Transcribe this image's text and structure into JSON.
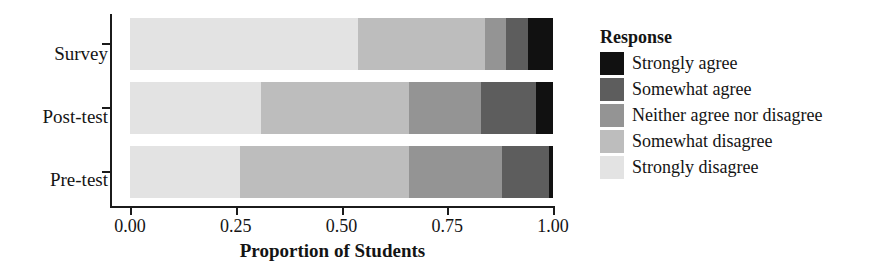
{
  "chart_data": {
    "type": "bar",
    "orientation": "horizontal",
    "stacked": true,
    "normalized": true,
    "title": "",
    "xlabel": "Proportion of Students",
    "ylabel": "",
    "xlim": [
      0.0,
      1.0
    ],
    "grid": false,
    "legend_position": "right",
    "legend_title": "Response",
    "categories": [
      "Pre-test",
      "Post-test",
      "Survey"
    ],
    "category_order_top_to_bottom": [
      "Survey",
      "Post-test",
      "Pre-test"
    ],
    "xticks": [
      "0.00",
      "0.25",
      "0.50",
      "0.75",
      "1.00"
    ],
    "xtick_values": [
      0.0,
      0.25,
      0.5,
      0.75,
      1.0
    ],
    "series": [
      {
        "name": "Strongly disagree",
        "color": "#e3e3e3",
        "values": [
          0.26,
          0.31,
          0.54
        ]
      },
      {
        "name": "Somewhat disagree",
        "color": "#bdbdbd",
        "values": [
          0.4,
          0.35,
          0.3
        ]
      },
      {
        "name": "Neither agree nor disagree",
        "color": "#949494",
        "values": [
          0.22,
          0.17,
          0.05
        ]
      },
      {
        "name": "Somewhat agree",
        "color": "#5d5d5d",
        "values": [
          0.11,
          0.13,
          0.05
        ]
      },
      {
        "name": "Strongly agree",
        "color": "#111111",
        "values": [
          0.01,
          0.04,
          0.06
        ]
      }
    ],
    "bars": [
      {
        "category": "Survey",
        "segments": [
          {
            "label": "Strongly disagree",
            "value": 0.54,
            "color": "#e3e3e3"
          },
          {
            "label": "Somewhat disagree",
            "value": 0.3,
            "color": "#bdbdbd"
          },
          {
            "label": "Neither agree nor disagree",
            "value": 0.05,
            "color": "#949494"
          },
          {
            "label": "Somewhat agree",
            "value": 0.05,
            "color": "#5d5d5d"
          },
          {
            "label": "Strongly agree",
            "value": 0.06,
            "color": "#111111"
          }
        ]
      },
      {
        "category": "Post-test",
        "segments": [
          {
            "label": "Strongly disagree",
            "value": 0.31,
            "color": "#e3e3e3"
          },
          {
            "label": "Somewhat disagree",
            "value": 0.35,
            "color": "#bdbdbd"
          },
          {
            "label": "Neither agree nor disagree",
            "value": 0.17,
            "color": "#949494"
          },
          {
            "label": "Somewhat agree",
            "value": 0.13,
            "color": "#5d5d5d"
          },
          {
            "label": "Strongly agree",
            "value": 0.04,
            "color": "#111111"
          }
        ]
      },
      {
        "category": "Pre-test",
        "segments": [
          {
            "label": "Strongly disagree",
            "value": 0.26,
            "color": "#e3e3e3"
          },
          {
            "label": "Somewhat disagree",
            "value": 0.4,
            "color": "#bdbdbd"
          },
          {
            "label": "Neither agree nor disagree",
            "value": 0.22,
            "color": "#949494"
          },
          {
            "label": "Somewhat agree",
            "value": 0.11,
            "color": "#5d5d5d"
          },
          {
            "label": "Strongly agree",
            "value": 0.01,
            "color": "#111111"
          }
        ]
      }
    ]
  },
  "axis": {
    "y_labels": {
      "survey": "Survey",
      "posttest": "Post-test",
      "pretest": "Pre-test"
    },
    "x_title": "Proportion of Students",
    "x_tick_labels": [
      "0.00",
      "0.25",
      "0.50",
      "0.75",
      "1.00"
    ]
  },
  "legend": {
    "title": "Response",
    "items": [
      {
        "label": "Strongly agree",
        "color": "#111111"
      },
      {
        "label": "Somewhat agree",
        "color": "#5d5d5d"
      },
      {
        "label": "Neither agree nor disagree",
        "color": "#949494"
      },
      {
        "label": "Somewhat disagree",
        "color": "#bdbdbd"
      },
      {
        "label": "Strongly disagree",
        "color": "#e3e3e3"
      }
    ]
  }
}
